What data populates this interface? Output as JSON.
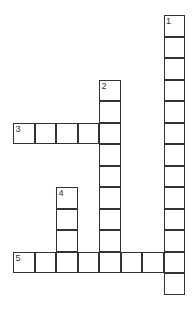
{
  "puzzle": {
    "type": "crossword",
    "rows": 14,
    "cols": 8,
    "entries": [
      {
        "number": "1",
        "direction": "down",
        "row": 0,
        "col": 7,
        "length": 13
      },
      {
        "number": "2",
        "direction": "down",
        "row": 3,
        "col": 4,
        "length": 9
      },
      {
        "number": "3",
        "direction": "across",
        "row": 5,
        "col": 0,
        "length": 5
      },
      {
        "number": "4",
        "direction": "down",
        "row": 8,
        "col": 2,
        "length": 4
      },
      {
        "number": "5",
        "direction": "across",
        "row": 11,
        "col": 0,
        "length": 8
      }
    ]
  }
}
